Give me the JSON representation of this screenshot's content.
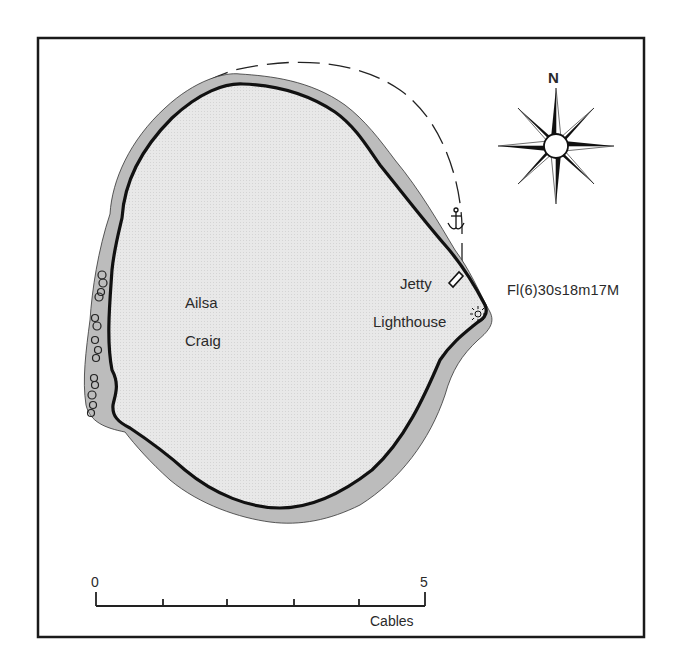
{
  "map": {
    "island": {
      "name_line1": "Ailsa",
      "name_line2": "Craig"
    },
    "features": {
      "jetty_label": "Jetty",
      "lighthouse_label": "Lighthouse",
      "light_characteristic": "Fl(6)30s18m17M",
      "anchorage_icon": "anchor-icon",
      "lighthouse_icon": "light-star-icon"
    },
    "compass": {
      "north_label": "N",
      "icon": "compass-rose-icon"
    },
    "scale_bar": {
      "start_label": "0",
      "end_label": "5",
      "unit_label": "Cables",
      "divisions": 5
    },
    "colors": {
      "land": "#e6e6e6",
      "foreshore": "#bdbdbd",
      "coastline": "#111111",
      "frame": "#1a1a1a",
      "background": "#ffffff"
    }
  }
}
